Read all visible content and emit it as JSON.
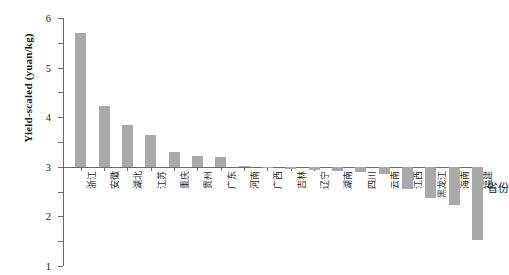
{
  "chart_data": {
    "type": "bar",
    "title": "",
    "xlabel": "省份",
    "ylabel": "Yield-scaled (yuan/kg)",
    "ylim": [
      -4,
      6
    ],
    "yticks": [
      6,
      5,
      4,
      3,
      2,
      1,
      0,
      -1,
      -2,
      -3,
      -4
    ],
    "ytick_labels": [
      "6",
      "5",
      "4",
      "3",
      "2",
      "1",
      "0",
      "-1",
      "-2",
      "-3",
      "-4"
    ],
    "grid": false,
    "legend": null,
    "bar_color": "#a9a9a9",
    "axis_color": "#6a6a6a",
    "categories": [
      "浙江",
      "安徽",
      "湖北",
      "江苏",
      "重庆",
      "贵州",
      "广东",
      "河南",
      "广西",
      "吉林",
      "辽宁",
      "湖南",
      "四川",
      "云南",
      "江西",
      "黑龙江",
      "海南",
      "福建"
    ],
    "values": [
      5.4,
      2.45,
      1.68,
      1.3,
      0.6,
      0.45,
      0.4,
      0.05,
      -0.05,
      -0.1,
      -0.12,
      -0.15,
      -0.2,
      -0.3,
      -0.9,
      -1.25,
      -1.55,
      -2.95
    ]
  }
}
